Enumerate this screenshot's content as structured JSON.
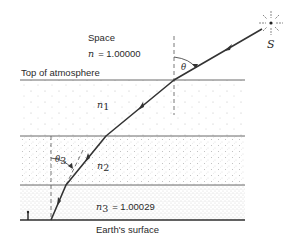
{
  "diagram": {
    "type": "atmospheric refraction",
    "space": {
      "label": "Space",
      "index_symbol": "n",
      "index_value": "= 1.00000"
    },
    "top_label": "Top of atmosphere",
    "surface_label": "Earth's surface",
    "source_label": "S",
    "angle_top": "θ",
    "angle_bottom_symbol": "θ",
    "angle_bottom_sub": "3",
    "layers": [
      {
        "symbol": "n",
        "sub": "1",
        "value": ""
      },
      {
        "symbol": "n",
        "sub": "2",
        "value": ""
      },
      {
        "symbol": "n",
        "sub": "3",
        "value": "= 1.00029"
      }
    ],
    "colors": {
      "line": "#3a3a3a",
      "ray": "#333333",
      "dots_light": "#b8b8b8",
      "dots_dense": "#a0a0a0"
    },
    "geometry": {
      "boundaries_y": [
        80,
        136,
        185,
        220
      ],
      "x_left": 20,
      "x_right": 245,
      "ray_points": [
        [
          262,
          29
        ],
        [
          174,
          80
        ],
        [
          106,
          136
        ],
        [
          66,
          185
        ],
        [
          51,
          220
        ]
      ],
      "star_center": [
        271,
        23
      ]
    }
  }
}
